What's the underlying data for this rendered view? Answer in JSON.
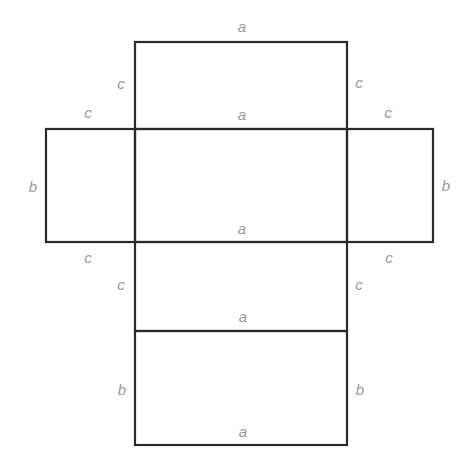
{
  "diagram": {
    "title": "",
    "type": "box net (unfolded rectangular prism)",
    "colors": {
      "edge": "#2a2a2a",
      "label": "#9a9a9a",
      "background": "#ffffff"
    },
    "faces": [
      {
        "id": "top-flap",
        "width": "a",
        "height": "c"
      },
      {
        "id": "left-flap",
        "width": "c",
        "height": "b"
      },
      {
        "id": "center-face",
        "width": "a",
        "height": "b"
      },
      {
        "id": "right-flap",
        "width": "c",
        "height": "b"
      },
      {
        "id": "lower-flap",
        "width": "a",
        "height": "c"
      },
      {
        "id": "bottom-face",
        "width": "a",
        "height": "b"
      }
    ],
    "labels": {
      "top_a": "a",
      "top_left_c": "c",
      "top_right_c": "c",
      "left_flap_top_c": "c",
      "right_flap_top_c": "c",
      "center_top_a": "a",
      "left_b": "b",
      "right_b": "b",
      "center_bottom_a": "a",
      "left_flap_bottom_c": "c",
      "right_flap_bottom_c": "c",
      "lower_left_c": "c",
      "lower_right_c": "c",
      "lower_a": "a",
      "bottom_left_b": "b",
      "bottom_right_b": "b",
      "bottom_a": "a"
    }
  }
}
